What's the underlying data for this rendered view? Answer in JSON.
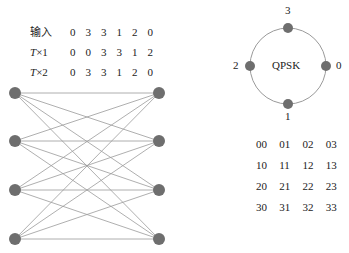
{
  "sequence_table": {
    "rows": [
      {
        "label": "输入",
        "values": [
          "0",
          "3",
          "3",
          "1",
          "2",
          "0"
        ]
      },
      {
        "label_italic": "T",
        "label_rest": "×1",
        "values": [
          "0",
          "0",
          "3",
          "3",
          "1",
          "2"
        ]
      },
      {
        "label_italic": "T",
        "label_rest": "×2",
        "values": [
          "0",
          "3",
          "3",
          "1",
          "2",
          "0"
        ]
      }
    ]
  },
  "trellis": {
    "left_nodes": [
      93,
      141,
      190,
      239
    ],
    "right_nodes": [
      93,
      141,
      190,
      239
    ],
    "left_x": 15,
    "right_x": 159,
    "node_color": "#6e6e6e",
    "edge_color": "#9a9a9a"
  },
  "constellation": {
    "title": "QPSK",
    "points": [
      {
        "label": "0",
        "position": "right"
      },
      {
        "label": "1",
        "position": "bottom"
      },
      {
        "label": "2",
        "position": "left"
      },
      {
        "label": "3",
        "position": "top"
      }
    ],
    "circle_color": "#9a9a9a",
    "point_color": "#6e6e6e"
  },
  "state_grid": {
    "rows": [
      [
        "00",
        "01",
        "02",
        "03"
      ],
      [
        "10",
        "11",
        "12",
        "13"
      ],
      [
        "20",
        "21",
        "22",
        "23"
      ],
      [
        "30",
        "31",
        "32",
        "33"
      ]
    ]
  }
}
